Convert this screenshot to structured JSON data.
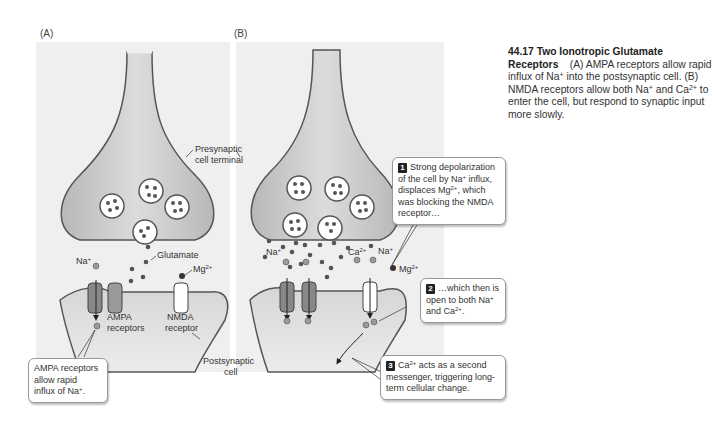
{
  "figure": {
    "panel_a_label": "(A)",
    "panel_b_label": "(B)",
    "caption": {
      "number_title": "44.17  Two Ionotropic Glutamate Receptors",
      "panel_ref_a": "(A)",
      "text_1": " AMPA receptors allow rapid influx of Na",
      "text_1_sup": "+",
      "text_2": " into the postsy­naptic cell. (B) NMDA receptors allow both Na",
      "text_2_sup": "+",
      "text_3": " and Ca",
      "text_3_sup": "2+",
      "text_4": " to enter the cell, but respond to synaptic input more slowly."
    }
  },
  "panel_a": {
    "labels": {
      "presynaptic": "Presynaptic",
      "cell_terminal": "cell terminal",
      "glutamate": "Glutamate",
      "na": "Na",
      "na_sup": "+",
      "mg": "Mg",
      "mg_sup": "2+",
      "ampa_1": "AMPA",
      "ampa_2": "receptors",
      "nmda_1": "NMDA",
      "nmda_2": "receptor",
      "postsynaptic": "Postsynaptic",
      "cell": "cell"
    },
    "callout": {
      "line1": "AMPA receptors",
      "line2": "allow rapid",
      "line3": "influx of Na",
      "line3_sup": "+",
      "line3_end": "."
    }
  },
  "panel_b": {
    "labels": {
      "na_left": "Na",
      "na_left_sup": "+",
      "ca": "Ca",
      "ca_sup": "2+",
      "na_right": "Na",
      "na_right_sup": "+",
      "mg": "Mg",
      "mg_sup": "2+"
    },
    "callouts": [
      {
        "step": "1",
        "text_a": "Strong depolarization of the cell by Na",
        "sup_a": "+",
        "text_b": " influx, displaces Mg",
        "sup_b": "2+",
        "text_c": ", which was blocking the NMDA receptor…"
      },
      {
        "step": "2",
        "text_a": "…which then is open to both Na",
        "sup_a": "+",
        "text_b": " and Ca",
        "sup_b": "2+",
        "text_c": "."
      },
      {
        "step": "3",
        "text_a": "Ca",
        "sup_a": "2+",
        "text_b": " acts as a second messenger, triggering long-term cellular change."
      }
    ]
  },
  "colors": {
    "panel_bg": "#efefef",
    "membrane": "#555555",
    "cell_fill": "#c8c8c8",
    "vesicle_fill": "#ffffff",
    "glutamate_dot": "#555555",
    "ion_dot": "#9a9a9a",
    "mg_dot": "#333333",
    "callout_border": "#999999"
  }
}
